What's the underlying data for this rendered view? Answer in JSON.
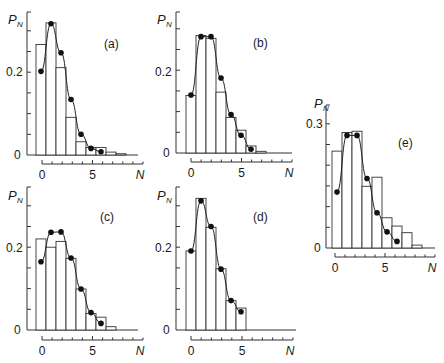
{
  "figure": {
    "y_label": "P",
    "y_label_sub": "N",
    "x_label": "N",
    "colors": {
      "ink": "#222222",
      "bar_fill": "#ffffff",
      "background": "#ffffff"
    }
  },
  "chart_data": [
    {
      "type": "bar",
      "panel": "(a)",
      "title": "(a)",
      "xlabel": "N",
      "ylabel": "P_N",
      "x_ticks": [
        "0",
        "5"
      ],
      "y_ticks": [
        "0",
        "0.2"
      ],
      "ylim": [
        0,
        0.3
      ],
      "xlim": [
        -0.5,
        9.5
      ],
      "categories": [
        0,
        1,
        2,
        3,
        4,
        5,
        6,
        7,
        8
      ],
      "series": [
        {
          "name": "histogram",
          "kind": "bar",
          "values": [
            0.267,
            0.319,
            0.211,
            0.091,
            0.032,
            0.018,
            0.018,
            0.007,
            0.003
          ]
        },
        {
          "name": "fit",
          "kind": "line+markers",
          "x": [
            0,
            1,
            2,
            3,
            4,
            5,
            6
          ],
          "values": [
            0.202,
            0.317,
            0.247,
            0.134,
            0.05,
            0.016,
            0.008
          ]
        }
      ]
    },
    {
      "type": "bar",
      "panel": "(b)",
      "title": "(b)",
      "xlabel": "N",
      "ylabel": "P_N",
      "x_ticks": [
        "0",
        "5"
      ],
      "y_ticks": [
        "0",
        "0.2"
      ],
      "ylim": [
        0,
        0.3
      ],
      "xlim": [
        -0.5,
        9.5
      ],
      "categories": [
        0,
        1,
        2,
        3,
        4,
        5,
        6,
        7
      ],
      "series": [
        {
          "name": "histogram",
          "kind": "bar",
          "values": [
            0.139,
            0.284,
            0.277,
            0.147,
            0.086,
            0.055,
            0.017,
            0.004
          ]
        },
        {
          "name": "fit",
          "kind": "line+markers",
          "x": [
            0,
            1,
            2,
            3,
            4,
            5,
            6
          ],
          "values": [
            0.14,
            0.281,
            0.281,
            0.181,
            0.093,
            0.043,
            0.009
          ]
        }
      ]
    },
    {
      "type": "bar",
      "panel": "(c)",
      "title": "(c)",
      "xlabel": "N",
      "ylabel": "P_N",
      "x_ticks": [
        "0",
        "5"
      ],
      "y_ticks": [
        "0",
        "0.2"
      ],
      "ylim": [
        0,
        0.3
      ],
      "xlim": [
        -0.5,
        9.5
      ],
      "categories": [
        0,
        1,
        2,
        3,
        4,
        5,
        6,
        7
      ],
      "series": [
        {
          "name": "histogram",
          "kind": "bar",
          "values": [
            0.22,
            0.2,
            0.214,
            0.173,
            0.099,
            0.04,
            0.031,
            0.008
          ]
        },
        {
          "name": "fit",
          "kind": "line+markers",
          "x": [
            0,
            1,
            2,
            3,
            4,
            5,
            6
          ],
          "values": [
            0.165,
            0.236,
            0.237,
            0.174,
            0.099,
            0.042,
            0.016
          ]
        }
      ]
    },
    {
      "type": "bar",
      "panel": "(d)",
      "title": "(d)",
      "xlabel": "N",
      "ylabel": "P_N",
      "x_ticks": [
        "0",
        "5"
      ],
      "y_ticks": [
        "0",
        "0.2"
      ],
      "ylim": [
        0,
        0.3
      ],
      "xlim": [
        -0.5,
        9.5
      ],
      "categories": [
        0,
        1,
        2,
        3,
        4,
        5
      ],
      "series": [
        {
          "name": "histogram",
          "kind": "bar",
          "values": [
            0.191,
            0.318,
            0.248,
            0.148,
            0.071,
            0.053
          ]
        },
        {
          "name": "fit",
          "kind": "line+markers",
          "x": [
            0,
            1,
            2,
            3,
            4,
            5
          ],
          "values": [
            0.191,
            0.312,
            0.25,
            0.147,
            0.071,
            0.044
          ]
        }
      ]
    },
    {
      "type": "bar",
      "panel": "(e)",
      "title": "(e)",
      "xlabel": "N",
      "ylabel": "P_N",
      "x_ticks": [
        "0",
        "5"
      ],
      "y_ticks": [
        "0",
        "0.3"
      ],
      "ylim": [
        0,
        0.3
      ],
      "xlim": [
        -0.5,
        9.5
      ],
      "categories": [
        0,
        1,
        2,
        3,
        4,
        5,
        6,
        7
      ],
      "series": [
        {
          "name": "histogram",
          "kind": "bar",
          "values": [
            0.234,
            0.279,
            0.282,
            0.149,
            0.171,
            0.073,
            0.053,
            0.037,
            0.007
          ]
        },
        {
          "name": "fit",
          "kind": "line+markers",
          "x": [
            0,
            1,
            2,
            3,
            4,
            5,
            6
          ],
          "values": [
            0.135,
            0.272,
            0.272,
            0.168,
            0.085,
            0.039,
            0.016
          ]
        }
      ]
    }
  ],
  "layout": {
    "panels": [
      {
        "id": "a",
        "axis_x": 27,
        "y0": 155,
        "top": 12,
        "bar_x0": 36,
        "tick_axis_y": 164,
        "tick_axis_x1": 42,
        "tick_axis_x2": 143,
        "base_x2": 138,
        "pn": [
          8,
          24
        ],
        "tag": [
          104,
          48
        ],
        "ylbl": [
          [
            14,
            159,
            "0"
          ],
          [
            6,
            76,
            "0.2"
          ]
        ],
        "xlbl_y": 179
      },
      {
        "id": "b",
        "axis_x": 176,
        "y0": 153,
        "top": 12,
        "bar_x0": 186,
        "tick_axis_y": 162,
        "tick_axis_x1": 191,
        "tick_axis_x2": 292,
        "base_x2": 292,
        "pn": [
          157,
          24
        ],
        "tag": [
          253,
          47
        ],
        "ylbl": [
          [
            163,
            157,
            "0"
          ],
          [
            155,
            76,
            "0.2"
          ]
        ],
        "xlbl_y": 177
      },
      {
        "id": "c",
        "axis_x": 27,
        "y0": 330,
        "top": 187,
        "bar_x0": 36,
        "tick_axis_y": 340,
        "tick_axis_x1": 42,
        "tick_axis_x2": 143,
        "base_x2": 138,
        "pn": [
          8,
          200
        ],
        "tag": [
          100,
          221
        ],
        "ylbl": [
          [
            14,
            334,
            "0"
          ],
          [
            6,
            252,
            "0.2"
          ]
        ],
        "xlbl_y": 355
      },
      {
        "id": "d",
        "axis_x": 176,
        "y0": 330,
        "top": 187,
        "bar_x0": 186,
        "tick_axis_y": 340,
        "tick_axis_x1": 191,
        "tick_axis_x2": 293,
        "base_x2": 296,
        "pn": [
          157,
          200
        ],
        "tag": [
          253,
          221
        ],
        "ylbl": [
          [
            163,
            334,
            "0"
          ],
          [
            155,
            252,
            "0.2"
          ]
        ],
        "xlbl_y": 355
      },
      {
        "id": "e",
        "axis_x": 326,
        "y0": 248,
        "top": 105,
        "bar_x0": 332,
        "tick_axis_y": 257,
        "tick_axis_x1": 335,
        "tick_axis_x2": 435,
        "base_x2": 435,
        "pn": [
          314,
          108
        ],
        "tag": [
          398,
          147
        ],
        "ylbl": [
          [
            314,
            252,
            "0"
          ],
          [
            306,
            128,
            "0.3"
          ]
        ],
        "xlbl_y": 272
      }
    ],
    "px_per_unit_y": 414,
    "bar_width": 10
  }
}
